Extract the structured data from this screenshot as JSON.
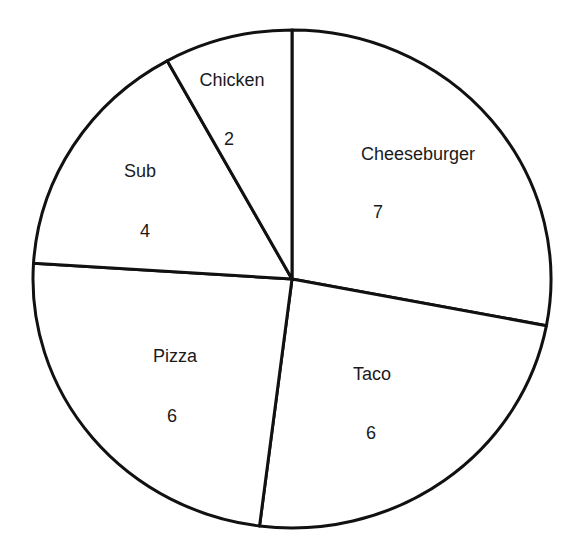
{
  "chart_data": {
    "type": "pie",
    "title": "",
    "start_angle_deg": -90,
    "direction": "clockwise",
    "categories": [
      "Cheeseburger",
      "Taco",
      "Pizza",
      "Sub",
      "Chicken"
    ],
    "values": [
      7,
      6,
      6,
      4,
      2
    ],
    "total": 25,
    "slices": [
      {
        "label": "Cheeseburger",
        "value": 7,
        "label_pos": [
          418,
          155
        ],
        "value_pos": [
          378,
          213
        ]
      },
      {
        "label": "Taco",
        "value": 6,
        "label_pos": [
          372,
          375
        ],
        "value_pos": [
          371,
          434
        ]
      },
      {
        "label": "Pizza",
        "value": 6,
        "label_pos": [
          175,
          357
        ],
        "value_pos": [
          172,
          417
        ]
      },
      {
        "label": "Sub",
        "value": 4,
        "label_pos": [
          140,
          172
        ],
        "value_pos": [
          145,
          232
        ]
      },
      {
        "label": "Chicken",
        "value": 2,
        "label_pos": [
          232,
          81
        ],
        "value_pos": [
          229,
          140
        ]
      }
    ],
    "geometry": {
      "cx": 292,
      "cy": 279,
      "rx": 259,
      "ry": 249
    },
    "style": {
      "fill": "#ffffff",
      "stroke": "#111111",
      "stroke_width": 3
    },
    "legend": "none",
    "grid": false
  }
}
